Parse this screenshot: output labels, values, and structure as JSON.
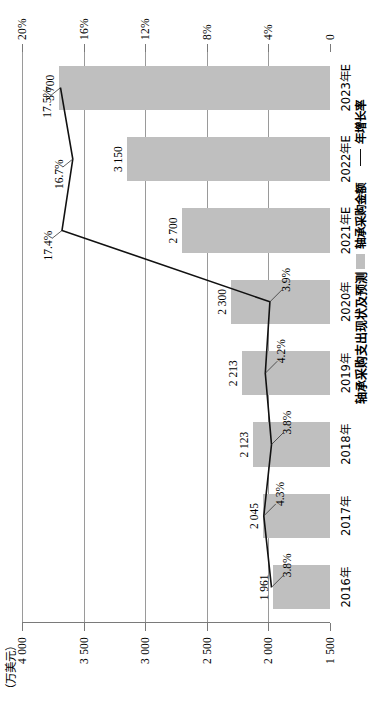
{
  "chart_data": {
    "type": "bar",
    "title": "轴承采购支出现状及预测",
    "xlabel": "",
    "ylabel": "（万美元）",
    "y2label": "",
    "ylim": [
      1500,
      4000
    ],
    "y2lim": [
      0,
      20
    ],
    "grid": true,
    "legend_position": "bottom-right",
    "categories": [
      "2016年",
      "2017年",
      "2018年",
      "2019年",
      "2020年",
      "2021年E",
      "2022年E",
      "2023年E"
    ],
    "y_ticks": [
      "1 500",
      "2 000",
      "2 500",
      "3 000",
      "3 500",
      "4 000"
    ],
    "y2_ticks": [
      "0",
      "4%",
      "8%",
      "12%",
      "16%",
      "20%"
    ],
    "series": [
      {
        "name": "轴承采购金额",
        "kind": "bar",
        "color": "#bfbfbf",
        "axis": "left",
        "values": [
          1961,
          2045,
          2123,
          2213,
          2300,
          2700,
          3150,
          3700
        ],
        "labels": [
          "1 961",
          "2 045",
          "2 123",
          "2 213",
          "2 300",
          "2 700",
          "3 150",
          "3 700"
        ]
      },
      {
        "name": "年增长率",
        "kind": "line",
        "color": "#111111",
        "axis": "right",
        "values": [
          3.8,
          4.3,
          3.8,
          4.2,
          3.9,
          17.4,
          16.7,
          17.5
        ],
        "labels": [
          "3.8%",
          "4.3%",
          "3.8%",
          "4.2%",
          "3.9%",
          "17.4%",
          "16.7%",
          "17.5%"
        ]
      }
    ]
  },
  "axis": {
    "unit_note": "（万美元）"
  },
  "legend": {
    "bar_label": "轴承采购金额",
    "line_label": "年增长率"
  }
}
